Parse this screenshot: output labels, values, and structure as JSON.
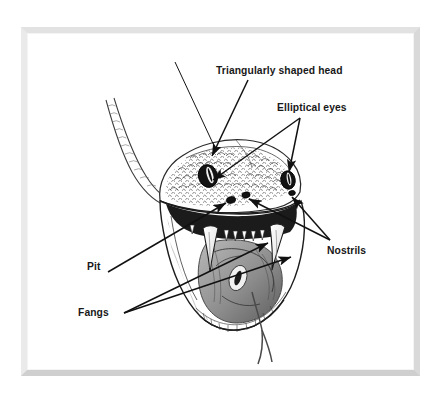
{
  "figure": {
    "frame": {
      "style": "light-gray-picture-frame",
      "color_top": "#e2e2e2",
      "color_left": "#eaeaea",
      "color_right": "#d9d9d9",
      "color_bottom": "#cfcfcf",
      "background": "#ffffff"
    },
    "ink_color": "#111111",
    "labels": [
      {
        "id": "triangular-head",
        "text": "Triangularly shaped head",
        "points_to": "top of the snake's head",
        "arrow_count": 1
      },
      {
        "id": "elliptical-eyes",
        "text": "Elliptical eyes",
        "points_to": "both eyes",
        "arrow_count": 2
      },
      {
        "id": "nostrils",
        "text": "Nostrils",
        "points_to": "both nostrils",
        "arrow_count": 2
      },
      {
        "id": "pit",
        "text": "Pit",
        "points_to": "heat-sensing pit between eye and nostril",
        "arrow_count": 1
      },
      {
        "id": "fangs",
        "text": "Fangs",
        "points_to": "both fangs in the open mouth",
        "arrow_count": 2
      }
    ],
    "illustration_parts": [
      "triangular head",
      "scaled neck and body",
      "elliptical pupil eyes",
      "nostrils",
      "heat-sensing pits",
      "open mouth",
      "upper and lower fangs",
      "throat",
      "forked tongue"
    ]
  }
}
